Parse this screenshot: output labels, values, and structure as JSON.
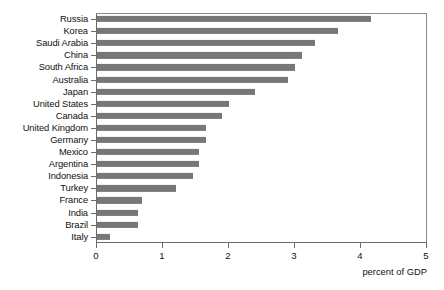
{
  "chart_data": {
    "type": "bar",
    "orientation": "horizontal",
    "title": "",
    "xlabel": "percent of GDP",
    "ylabel": "",
    "xlim": [
      0,
      5
    ],
    "xticks": [
      0,
      1,
      2,
      3,
      4,
      5
    ],
    "xtick_labels": [
      "0",
      "1",
      "2",
      "3",
      "4",
      "5"
    ],
    "grid": false,
    "legend": null,
    "bar_color": "#777777",
    "axis_color": "#6b6b6b",
    "categories": [
      "Russia",
      "Korea",
      "Saudi Arabia",
      "China",
      "South Africa",
      "Australia",
      "Japan",
      "United States",
      "Canada",
      "United  Kingdom",
      "Germany",
      "Mexico",
      "Argentina",
      "Indonesia",
      "Turkey",
      "France",
      "India",
      "Brazil",
      "Italy"
    ],
    "values": [
      4.15,
      3.65,
      3.3,
      3.1,
      3.0,
      2.9,
      2.4,
      2.0,
      1.9,
      1.65,
      1.65,
      1.55,
      1.55,
      1.45,
      1.2,
      0.68,
      0.62,
      0.62,
      0.2
    ]
  }
}
